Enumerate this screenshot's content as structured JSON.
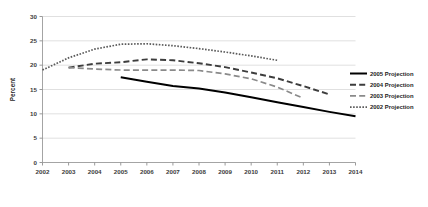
{
  "chart_data": {
    "type": "line",
    "title": "",
    "xlabel": "",
    "ylabel": "Percent",
    "x": [
      2002,
      2003,
      2004,
      2005,
      2006,
      2007,
      2008,
      2009,
      2010,
      2011,
      2012,
      2013,
      2014
    ],
    "xticklabels": [
      "2002",
      "2003",
      "2004",
      "2005",
      "2006",
      "2007",
      "2008",
      "2009",
      "2010",
      "2011",
      "2012",
      "2013",
      "2014"
    ],
    "yticks": [
      0,
      5,
      10,
      15,
      20,
      25,
      30
    ],
    "yticklabels": [
      "0",
      "5",
      "10",
      "15",
      "20",
      "25",
      "30"
    ],
    "ylim": [
      0,
      30
    ],
    "xlim": [
      2002,
      2014
    ],
    "grid": true,
    "grid_axis": "y",
    "legend_position": "right",
    "series": [
      {
        "name": "2005 Projection",
        "style": "solid",
        "color": "#000000",
        "width": 2.0,
        "x": [
          2005,
          2006,
          2007,
          2008,
          2009,
          2010,
          2011,
          2012,
          2013,
          2014
        ],
        "values": [
          17.5,
          16.6,
          15.7,
          15.2,
          14.4,
          13.4,
          12.4,
          11.4,
          10.4,
          9.5
        ]
      },
      {
        "name": "2004 Projection",
        "style": "dashed",
        "color": "#3d3d3d",
        "width": 1.9,
        "x": [
          2003,
          2004,
          2005,
          2006,
          2007,
          2008,
          2009,
          2010,
          2011,
          2012,
          2013
        ],
        "values": [
          19.5,
          20.3,
          20.6,
          21.2,
          21.0,
          20.4,
          19.6,
          18.5,
          17.3,
          15.7,
          14.0
        ]
      },
      {
        "name": "2003 Projection",
        "style": "dashed",
        "color": "#8a8a8a",
        "width": 1.7,
        "x": [
          2003,
          2004,
          2005,
          2006,
          2007,
          2008,
          2009,
          2010,
          2011,
          2012
        ],
        "values": [
          19.5,
          19.2,
          19.0,
          19.0,
          19.0,
          18.9,
          18.2,
          17.2,
          15.5,
          13.2
        ]
      },
      {
        "name": "2002 Projection",
        "style": "dotted",
        "color": "#5a5a5a",
        "width": 1.7,
        "x": [
          2002,
          2003,
          2004,
          2005,
          2006,
          2007,
          2008,
          2009,
          2010,
          2011
        ],
        "values": [
          19.0,
          21.5,
          23.3,
          24.3,
          24.4,
          24.0,
          23.4,
          22.7,
          21.9,
          21.0
        ]
      }
    ]
  },
  "legend": {
    "items": [
      {
        "label": "2005 Projection"
      },
      {
        "label": "2004 Projection"
      },
      {
        "label": "2003 Projection"
      },
      {
        "label": "2002 Projection"
      }
    ]
  }
}
